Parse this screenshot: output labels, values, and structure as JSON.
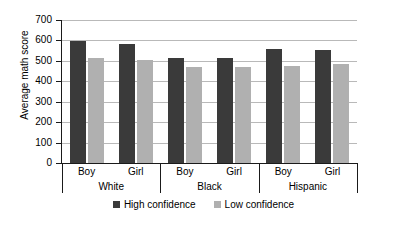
{
  "chart_data": {
    "type": "bar",
    "title": "",
    "xlabel": "",
    "ylabel": "Average math score",
    "ylim": [
      0,
      700
    ],
    "ytick_step": 100,
    "yticks": [
      0,
      100,
      200,
      300,
      400,
      500,
      600,
      700
    ],
    "ytick_labels": [
      "0",
      "100",
      "200",
      "300",
      "400",
      "500",
      "600",
      "700"
    ],
    "grid": true,
    "legend_position": "bottom-center",
    "groups": [
      "White",
      "Black",
      "Hispanic"
    ],
    "subgroups": [
      "Boy",
      "Girl"
    ],
    "categories": [
      "White Boy",
      "White Girl",
      "Black Boy",
      "Black Girl",
      "Hispanic Boy",
      "Hispanic Girl"
    ],
    "series": [
      {
        "name": "High confidence",
        "color": "#3a3a3a",
        "values": [
          595,
          585,
          515,
          515,
          560,
          555
        ]
      },
      {
        "name": "Low confidence",
        "color": "#b0b0b0",
        "values": [
          515,
          505,
          470,
          470,
          475,
          485
        ]
      }
    ]
  },
  "axis": {
    "y_title": "Average math score"
  },
  "legend": {
    "items": [
      {
        "label": "High confidence",
        "color": "#3a3a3a"
      },
      {
        "label": "Low confidence",
        "color": "#b0b0b0"
      }
    ]
  },
  "group_labels": [
    {
      "name": "White"
    },
    {
      "name": "Black"
    },
    {
      "name": "Hispanic"
    }
  ],
  "sub_labels": [
    {
      "name": "Boy"
    },
    {
      "name": "Girl"
    },
    {
      "name": "Boy"
    },
    {
      "name": "Girl"
    },
    {
      "name": "Boy"
    },
    {
      "name": "Girl"
    }
  ]
}
